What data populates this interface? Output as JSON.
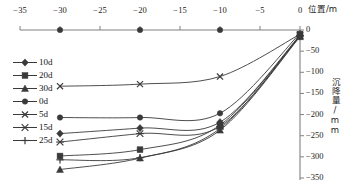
{
  "chart_data": {
    "type": "line",
    "title": "",
    "xlabel": "位置/m",
    "ylabel": "沉降量/mm",
    "xlim": [
      -35,
      0
    ],
    "ylim": [
      -350,
      0
    ],
    "xticks": [
      -35,
      -30,
      -25,
      -20,
      -15,
      -10,
      -5,
      0
    ],
    "yticks": [
      0,
      -50,
      -100,
      -150,
      -200,
      -250,
      -300,
      -350
    ],
    "xtick_labels": [
      "−35",
      "−30",
      "−25",
      "−20",
      "−15",
      "−10",
      "−5",
      "0"
    ],
    "ytick_labels": [
      "0",
      "−50",
      "−100",
      "−150",
      "−200",
      "−250",
      "−300",
      "−350"
    ],
    "x_axis_position": "top",
    "y_axis_position": "right",
    "grid": false,
    "legend_position": "left-middle",
    "x": [
      -30,
      -20,
      -10,
      0
    ],
    "series": [
      {
        "name": "10d",
        "marker": "diamond",
        "values": [
          -245,
          -232,
          -218,
          -12
        ]
      },
      {
        "name": "20d",
        "marker": "square",
        "values": [
          -298,
          -283,
          -225,
          -14
        ]
      },
      {
        "name": "30d",
        "marker": "triangle",
        "values": [
          -330,
          -303,
          -237,
          -16
        ]
      },
      {
        "name": "0d",
        "marker": "circle",
        "values": [
          -207,
          -207,
          -197,
          -8
        ]
      },
      {
        "name": "5d",
        "marker": "cross",
        "values": [
          -133,
          -128,
          -110,
          -10
        ]
      },
      {
        "name": "15d",
        "marker": "asterisk",
        "values": [
          -265,
          -245,
          -228,
          -13
        ]
      },
      {
        "name": "25d",
        "marker": "plus",
        "values": [
          -307,
          -302,
          -233,
          -15
        ]
      }
    ],
    "axis_marker_series": {
      "name": "axis-dots",
      "x": [
        -30,
        -20,
        -10,
        0
      ],
      "values": [
        0,
        0,
        0,
        0
      ],
      "marker": "circle"
    },
    "colors": {
      "line": "#3a3a3a",
      "axis": "#808080",
      "text": "#1a1a1a"
    }
  }
}
